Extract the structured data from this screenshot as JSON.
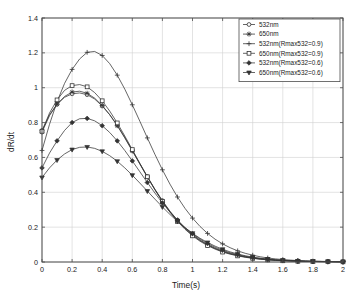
{
  "chart_data": {
    "type": "line",
    "title": "",
    "xlabel": "Time(s)",
    "ylabel": "dR/dt",
    "xlim": [
      0,
      2
    ],
    "ylim": [
      0,
      1.4
    ],
    "xticks": [
      "0",
      "0.2",
      "0.4",
      "0.6",
      "0.8",
      "1",
      "1.2",
      "1.4",
      "1.6",
      "1.8",
      "2"
    ],
    "xtick_values": [
      0,
      0.2,
      0.4,
      0.6,
      0.8,
      1.0,
      1.2,
      1.4,
      1.6,
      1.8,
      2.0
    ],
    "yticks": [
      "0",
      "0.2",
      "0.4",
      "0.6",
      "0.8",
      "1",
      "1.2",
      "1.4"
    ],
    "ytick_values": [
      0,
      0.2,
      0.4,
      0.6,
      0.8,
      1.0,
      1.2,
      1.4
    ],
    "grid": true,
    "legend_position": "top-right",
    "line_color": "#333333",
    "grid_color": "#d0d0d0",
    "axis_color": "#4d4d4d",
    "x": [
      0,
      0.05,
      0.1,
      0.15,
      0.2,
      0.25,
      0.3,
      0.35,
      0.4,
      0.45,
      0.5,
      0.55,
      0.6,
      0.65,
      0.7,
      0.75,
      0.8,
      0.85,
      0.9,
      0.95,
      1.0,
      1.05,
      1.1,
      1.15,
      1.2,
      1.25,
      1.3,
      1.35,
      1.4,
      1.45,
      1.5,
      1.55,
      1.6,
      1.65,
      1.7,
      1.75,
      1.8,
      1.85,
      1.9,
      1.95,
      2.0
    ],
    "series": [
      {
        "name": "532nm",
        "marker": "circle",
        "values": [
          0.755,
          0.845,
          0.905,
          0.945,
          0.965,
          0.97,
          0.96,
          0.935,
          0.895,
          0.845,
          0.785,
          0.715,
          0.64,
          0.565,
          0.49,
          0.418,
          0.352,
          0.292,
          0.24,
          0.195,
          0.157,
          0.126,
          0.1,
          0.079,
          0.062,
          0.049,
          0.038,
          0.03,
          0.023,
          0.018,
          0.014,
          0.011,
          0.009,
          0.007,
          0.005,
          0.004,
          0.003,
          0.003,
          0.002,
          0.002,
          0.001
        ]
      },
      {
        "name": "650nm",
        "marker": "star",
        "values": [
          0.745,
          0.84,
          0.905,
          0.95,
          0.975,
          0.98,
          0.968,
          0.94,
          0.898,
          0.845,
          0.782,
          0.712,
          0.637,
          0.562,
          0.487,
          0.415,
          0.349,
          0.289,
          0.237,
          0.192,
          0.154,
          0.123,
          0.098,
          0.077,
          0.06,
          0.047,
          0.037,
          0.029,
          0.022,
          0.017,
          0.013,
          0.01,
          0.008,
          0.006,
          0.005,
          0.004,
          0.003,
          0.002,
          0.002,
          0.001,
          0.001
        ]
      },
      {
        "name": "532nm(Rmax532=0.9)",
        "marker": "plus",
        "values": [
          0.64,
          0.79,
          0.92,
          1.025,
          1.105,
          1.165,
          1.203,
          1.208,
          1.185,
          1.138,
          1.072,
          0.992,
          0.902,
          0.808,
          0.712,
          0.618,
          0.529,
          0.447,
          0.373,
          0.308,
          0.252,
          0.204,
          0.164,
          0.131,
          0.104,
          0.082,
          0.064,
          0.05,
          0.039,
          0.03,
          0.023,
          0.018,
          0.014,
          0.011,
          0.008,
          0.006,
          0.005,
          0.004,
          0.003,
          0.002,
          0.002
        ]
      },
      {
        "name": "650nm(Rmax532=0.9)",
        "marker": "square",
        "values": [
          0.75,
          0.855,
          0.93,
          0.985,
          1.012,
          1.018,
          1.005,
          0.972,
          0.925,
          0.866,
          0.798,
          0.723,
          0.645,
          0.566,
          0.489,
          0.415,
          0.347,
          0.286,
          0.233,
          0.188,
          0.15,
          0.119,
          0.094,
          0.074,
          0.057,
          0.045,
          0.035,
          0.027,
          0.021,
          0.016,
          0.012,
          0.009,
          0.007,
          0.006,
          0.004,
          0.003,
          0.003,
          0.002,
          0.002,
          0.001,
          0.001
        ]
      },
      {
        "name": "532nm(Rmax532=0.6)",
        "marker": "diamond",
        "values": [
          0.54,
          0.625,
          0.695,
          0.755,
          0.8,
          0.822,
          0.824,
          0.81,
          0.782,
          0.743,
          0.695,
          0.64,
          0.58,
          0.518,
          0.456,
          0.396,
          0.339,
          0.287,
          0.24,
          0.198,
          0.162,
          0.132,
          0.106,
          0.085,
          0.067,
          0.053,
          0.042,
          0.033,
          0.025,
          0.02,
          0.015,
          0.012,
          0.009,
          0.007,
          0.006,
          0.004,
          0.003,
          0.003,
          0.002,
          0.002,
          0.001
        ]
      },
      {
        "name": "650nm(Rmax532=0.6)",
        "marker": "triangle-down",
        "values": [
          0.485,
          0.54,
          0.585,
          0.62,
          0.645,
          0.658,
          0.66,
          0.652,
          0.635,
          0.61,
          0.578,
          0.54,
          0.498,
          0.453,
          0.407,
          0.361,
          0.316,
          0.273,
          0.233,
          0.197,
          0.165,
          0.136,
          0.112,
          0.091,
          0.073,
          0.058,
          0.046,
          0.036,
          0.028,
          0.022,
          0.017,
          0.013,
          0.01,
          0.008,
          0.006,
          0.005,
          0.004,
          0.003,
          0.002,
          0.002,
          0.001
        ]
      }
    ],
    "legend": [
      "532nm",
      "650nm",
      "532nm(Rmax532=0.9)",
      "650nm(Rmax532=0.9)",
      "532nm(Rmax532=0.6)",
      "650nm(Rmax532=0.6)"
    ]
  }
}
